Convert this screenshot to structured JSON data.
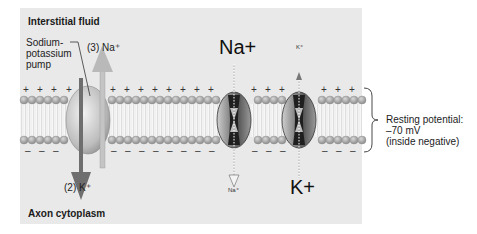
{
  "labels": {
    "interstitial_fluid": "Interstitial fluid",
    "axon_cytoplasm": "Axon cytoplasm",
    "pump_line1": "Sodium-",
    "pump_line2": "potassium",
    "pump_line3": "pump",
    "pump_na": "(3) Na⁺",
    "pump_k": "(2) K⁺",
    "na_channel_top": "Na+",
    "na_channel_bottom": "Na⁺",
    "k_channel_top": "K⁺",
    "k_channel_bottom": "K+",
    "resting_line1": "Resting potential:",
    "resting_line2": "–70 mV",
    "resting_line3": "(inside negative)"
  },
  "charges": {
    "outside": "+",
    "inside": "–"
  },
  "colors": {
    "panel": "#e9e9e9",
    "head": "#a8a8a8",
    "tail": "#ffffff",
    "k_arrow": "#6e6e6e",
    "na_arrow": "#b9b9b9",
    "channel_dark": "#2a2a2a"
  }
}
